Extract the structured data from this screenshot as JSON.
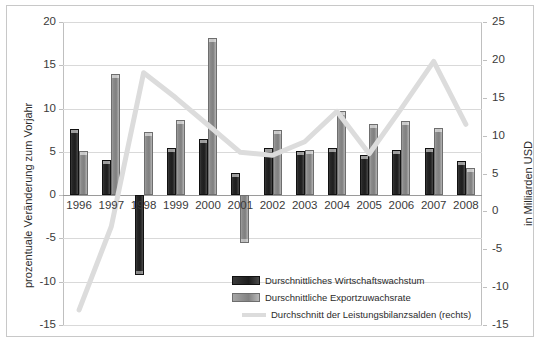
{
  "chart_data": {
    "type": "bar",
    "title": "",
    "subtitle": "",
    "categories": [
      "1996",
      "1997",
      "1998",
      "1999",
      "2000",
      "2001",
      "2002",
      "2003",
      "2004",
      "2005",
      "2006",
      "2007",
      "2008"
    ],
    "series": [
      {
        "name": "Durschnittliches Wirtschaftswachstum",
        "axis": "left",
        "render": "bar",
        "color": "#262626",
        "values": [
          7.7,
          4.1,
          -9.2,
          5.4,
          6.5,
          2.6,
          5.4,
          5.1,
          5.5,
          4.6,
          5.2,
          5.5,
          3.9
        ]
      },
      {
        "name": "Durschnittliche Exportzuwachsrate",
        "axis": "left",
        "render": "bar",
        "color": "#8a8a8a",
        "values": [
          5.1,
          14.0,
          7.3,
          8.7,
          18.2,
          -5.5,
          7.5,
          5.2,
          9.7,
          8.2,
          8.6,
          7.8,
          3.1
        ]
      },
      {
        "name": "Durchschnitt der Leistungsbilanzsalden (rechts)",
        "axis": "right",
        "render": "line",
        "color": "#dcdcdc",
        "values": [
          -13.0,
          -2.0,
          18.3,
          15.0,
          11.4,
          7.8,
          7.4,
          9.2,
          13.2,
          7.6,
          13.6,
          19.8,
          11.5
        ]
      }
    ],
    "xlabel": "",
    "ylabel": "prozentuale Veränderung zum Vorjahr",
    "y2label": "in Milliarden USD",
    "ylim": [
      -15,
      20
    ],
    "y2lim": [
      -15,
      25
    ],
    "yticks": [
      "20",
      "15",
      "10",
      "5",
      "0",
      "-5",
      "-10",
      "-15"
    ],
    "y2ticks": [
      "25",
      "20",
      "15",
      "10",
      "5",
      "0",
      "-5",
      "-10",
      "-15"
    ],
    "grid": true,
    "legend_position": "inside-bottom-right"
  },
  "axes": {
    "left_title": "prozentuale Veränderung zum Vorjahr",
    "right_title": "in Milliarden USD",
    "left_ticks": [
      "20",
      "15",
      "10",
      "5",
      "0",
      "-5",
      "-10",
      "-15"
    ],
    "right_ticks": [
      "25",
      "20",
      "15",
      "10",
      "5",
      "0",
      "-5",
      "-10",
      "-15"
    ],
    "x_ticks": [
      "1996",
      "1997",
      "1998",
      "1999",
      "2000",
      "2001",
      "2002",
      "2003",
      "2004",
      "2005",
      "2006",
      "2007",
      "2008"
    ]
  },
  "legend": {
    "items": [
      {
        "label": "Durschnittliches Wirtschaftswachstum",
        "type": "bar-dark"
      },
      {
        "label": "Durschnittliche Exportzuwachsrate",
        "type": "bar-gray"
      },
      {
        "label": "Durchschnitt der Leistungsbilanzsalden (rechts)",
        "type": "line"
      }
    ]
  }
}
